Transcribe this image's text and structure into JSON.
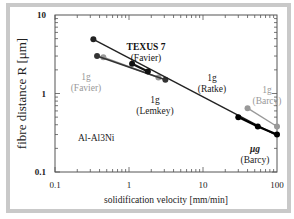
{
  "chart_data": {
    "type": "line",
    "title": "",
    "xlabel": "solidification velocity [mm/min]",
    "ylabel": "fibre distance R [μm]",
    "xscale": "log",
    "yscale": "log",
    "xlim": [
      0.1,
      100
    ],
    "ylim": [
      0.1,
      10
    ],
    "xticks": [
      "0.1",
      "1",
      "10",
      "100"
    ],
    "yticks": [
      "0.1",
      "1",
      "10"
    ],
    "grid": false,
    "annotations": [
      {
        "text": "Al-Al3Ni",
        "x": 0.25,
        "y": 0.25
      }
    ],
    "series": [
      {
        "name": "1g (Ratke)",
        "color": "#222222",
        "label_lines": [
          "1g",
          "(Ratke)"
        ],
        "x": [
          0.33,
          100
        ],
        "y": [
          4.9,
          0.29
        ]
      },
      {
        "name": "TEXUS 7 (Favier)",
        "color": "#111111",
        "label_lines": [
          "TEXUS 7",
          "(Favier)"
        ],
        "x": [
          1.1,
          1.8
        ],
        "y": [
          2.4,
          1.9
        ]
      },
      {
        "name": "1g (Lemkey)",
        "color": "#333333",
        "label_lines": [
          "1g",
          "(Lemkey)"
        ],
        "x": [
          0.37,
          3.1
        ],
        "y": [
          3.0,
          1.5
        ]
      },
      {
        "name": "1g (Favier)",
        "color": "#999999",
        "label_lines": [
          "1g",
          "(Favier)"
        ],
        "x": [
          0.45,
          2.5
        ],
        "y": [
          2.9,
          1.6
        ]
      },
      {
        "name": "μg (Barcy)",
        "color": "#000000",
        "label_lines": [
          "μg",
          "(Barcy)"
        ],
        "x": [
          30,
          55,
          100
        ],
        "y": [
          0.5,
          0.38,
          0.3
        ]
      },
      {
        "name": "1g (Barcy)",
        "color": "#999999",
        "label_lines": [
          "1g",
          "(Barcy)"
        ],
        "x": [
          40,
          100
        ],
        "y": [
          0.65,
          0.38
        ]
      }
    ]
  }
}
